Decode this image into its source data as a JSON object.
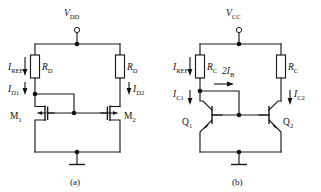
{
  "figure": {
    "type": "schematic-diagram",
    "panels": [
      {
        "id": "a",
        "caption": "(a)",
        "technology": "MOSFET",
        "supply_label": "V",
        "supply_sub": "DD",
        "supply_terminal": "open-circle",
        "resistors": [
          {
            "name": "R",
            "sub": "D",
            "side": "left"
          },
          {
            "name": "R",
            "sub": "D",
            "side": "right"
          }
        ],
        "currents": [
          {
            "name": "I",
            "sub": "REF",
            "direction": "down",
            "location": "left-resistor"
          },
          {
            "name": "I",
            "sub": "D1",
            "direction": "down",
            "location": "left-drain"
          },
          {
            "name": "I",
            "sub": "D2",
            "direction": "down",
            "location": "right-drain"
          }
        ],
        "devices": [
          {
            "name": "M",
            "sub": "1",
            "label_side": "left",
            "connection": "diode-connected"
          },
          {
            "name": "M",
            "sub": "2",
            "label_side": "right",
            "connection": "mirror"
          }
        ],
        "ground": "ground-symbol"
      },
      {
        "id": "b",
        "caption": "(b)",
        "technology": "BJT",
        "supply_label": "V",
        "supply_sub": "CC",
        "supply_terminal": "open-circle",
        "resistors": [
          {
            "name": "R",
            "sub": "C",
            "side": "left"
          },
          {
            "name": "R",
            "sub": "C",
            "side": "right"
          }
        ],
        "currents": [
          {
            "name": "I",
            "sub": "REF",
            "direction": "down",
            "location": "left-resistor"
          },
          {
            "name": "2I",
            "sub": "B",
            "direction": "right",
            "location": "base-node"
          },
          {
            "name": "I",
            "sub": "C1",
            "direction": "down",
            "location": "left-collector"
          },
          {
            "name": "I",
            "sub": "C2",
            "direction": "down",
            "location": "right-collector"
          }
        ],
        "devices": [
          {
            "name": "Q",
            "sub": "1",
            "label_side": "left",
            "connection": "diode-connected"
          },
          {
            "name": "Q",
            "sub": "2",
            "label_side": "right",
            "connection": "mirror"
          }
        ],
        "ground": "ground-symbol"
      }
    ],
    "colors": {
      "line": "#1a1a1a",
      "fill": "#ffffff",
      "node": "#111111",
      "text": "#111111"
    }
  }
}
